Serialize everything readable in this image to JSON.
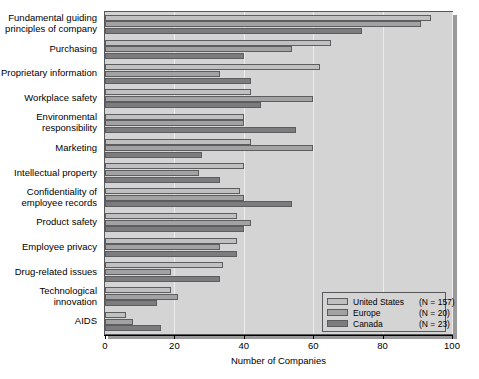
{
  "chart_data": {
    "type": "bar",
    "orientation": "horizontal",
    "title": "",
    "xlabel": "Number of Companies",
    "ylabel": "",
    "xlim": [
      0,
      100
    ],
    "xticks": [
      0,
      20,
      40,
      60,
      80,
      100
    ],
    "grid": true,
    "legend_position": "bottom-right",
    "categories": [
      "Fundamental guiding\nprinciples of company",
      "Purchasing",
      "Proprietary information",
      "Workplace safety",
      "Environmental\nresponsibility",
      "Marketing",
      "Intellectual property",
      "Confidentiality of\nemployee records",
      "Product safety",
      "Employee privacy",
      "Drug-related issues",
      "Technological\ninnovation",
      "AIDS"
    ],
    "series": [
      {
        "name": "United States",
        "n_label": "(N = 157)",
        "color": "#c0c0c0",
        "values": [
          94,
          65,
          62,
          42,
          40,
          42,
          40,
          39,
          38,
          38,
          34,
          19,
          6
        ]
      },
      {
        "name": "Europe",
        "n_label": "(N = 20)",
        "color": "#a2a2a2",
        "values": [
          91,
          54,
          33,
          60,
          40,
          60,
          27,
          40,
          42,
          33,
          19,
          21,
          8
        ]
      },
      {
        "name": "Canada",
        "n_label": "(N = 23)",
        "color": "#7c7c7e",
        "values": [
          74,
          40,
          42,
          45,
          55,
          28,
          33,
          54,
          40,
          38,
          33,
          15,
          16
        ]
      }
    ]
  },
  "legend": {
    "rows": [
      {
        "label": "United States",
        "n": "(N = 157)"
      },
      {
        "label": "Europe",
        "n": "(N = 20)"
      },
      {
        "label": "Canada",
        "n": "(N = 23)"
      }
    ]
  },
  "axis": {
    "x_title": "Number of Companies",
    "x_ticks": [
      "0",
      "20",
      "40",
      "60",
      "80",
      "100"
    ]
  },
  "colors": {
    "plot_background": "#d4d4d4",
    "frame": "#58585a",
    "gridline": "#ececed",
    "series_us": "#c0c0c0",
    "series_europe": "#a2a2a2",
    "series_canada": "#7c7c7e",
    "page_background": "#ffffff"
  }
}
